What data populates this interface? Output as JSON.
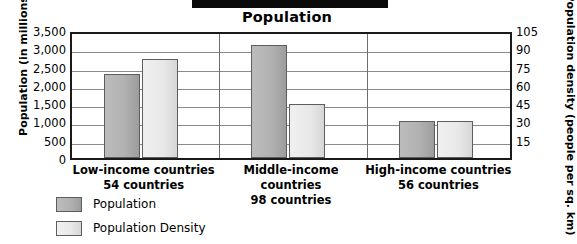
{
  "chart_data": {
    "type": "bar",
    "title": "Population",
    "categories": [
      "Low-income countries",
      "Middle-income countries",
      "High-income countries"
    ],
    "category_sublabels": [
      "54 countries",
      "98 countries",
      "56 countries"
    ],
    "series": [
      {
        "name": "Population",
        "axis": "left",
        "values": [
          2300,
          3100,
          1020
        ]
      },
      {
        "name": "Population Density",
        "axis": "right",
        "values": [
          81,
          44,
          30
        ]
      }
    ],
    "ylabel": "Population (in millions)",
    "ylabel_right": "Population density (people per sq. km)",
    "xlabel": "",
    "ylim": [
      0,
      3500
    ],
    "ylim_right": [
      0,
      105
    ],
    "yticks": [
      "3,500",
      "3,000",
      "2,500",
      "2,000",
      "1,500",
      "1,000",
      "500",
      "0"
    ],
    "yticks_right": [
      "105",
      "90",
      "75",
      "60",
      "45",
      "30",
      "15"
    ],
    "grid": true,
    "legend_position": "bottom-left",
    "legend": [
      "Population",
      "Population Density"
    ],
    "colors": {
      "series_population": "#b2b2b2",
      "series_density": "#e8e8e8",
      "axis": "#1a1a1a",
      "gridline": "#8a8a8a",
      "text": "#000000"
    }
  }
}
